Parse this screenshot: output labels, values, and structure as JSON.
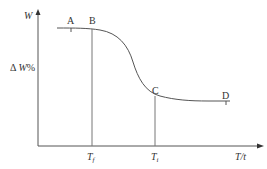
{
  "diagram": {
    "title": "",
    "y_axis": {
      "label_top": "W",
      "label_mid": "ΔW%"
    },
    "x_axis": {
      "label": "T/t"
    },
    "points": [
      {
        "name": "A",
        "label": "A"
      },
      {
        "name": "B",
        "label": "B"
      },
      {
        "name": "C",
        "label": "C"
      },
      {
        "name": "D",
        "label": "D"
      }
    ],
    "x_markers": [
      {
        "name": "Tf",
        "label": "T",
        "sub": "f"
      },
      {
        "name": "Ti",
        "label": "T",
        "sub": "i"
      }
    ],
    "line_color": "#555555"
  }
}
